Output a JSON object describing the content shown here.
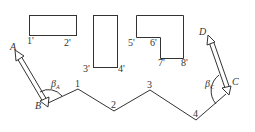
{
  "buildings": [
    {
      "id": "rect1",
      "corner_labels": [
        "1'",
        "2'"
      ]
    },
    {
      "id": "rect2",
      "corner_labels": [
        "3'",
        "4'"
      ]
    },
    {
      "id": "lshape",
      "corner_labels": [
        "5'",
        "6'",
        "7'",
        "8'"
      ]
    }
  ],
  "traverse": {
    "points": [
      "B",
      "1",
      "2",
      "3",
      "4",
      "C"
    ],
    "labels": {
      "p1": "1",
      "p2": "2",
      "p3": "3",
      "p4": "4"
    }
  },
  "control_points": {
    "A": "A",
    "B": "B",
    "C": "C",
    "D": "D"
  },
  "angles": {
    "beta_A": {
      "symbol": "β",
      "sub": "A"
    },
    "beta_C": {
      "symbol": "β",
      "sub": "C"
    }
  },
  "colors": {
    "stroke": "#333333",
    "background": "#ffffff"
  }
}
